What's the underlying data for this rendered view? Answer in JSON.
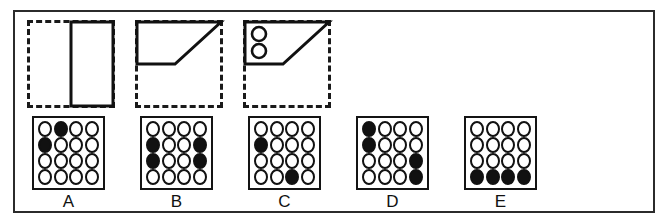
{
  "puzzle": {
    "type": "visual-analogy-matrix",
    "stroke_color": "#111111",
    "fill_color": "#111111",
    "background_color": "#ffffff",
    "frame_color": "#2b2b2b"
  },
  "stimuli": [
    {
      "id": "stimulus-1",
      "description": "dashed square with solid tall rectangle on right half",
      "shape": "rectangle",
      "dashed_box": true,
      "circles": 0
    },
    {
      "id": "stimulus-2",
      "description": "dashed square with solid trapezoid occupying top portion",
      "shape": "trapezoid",
      "dashed_box": true,
      "circles": 0
    },
    {
      "id": "stimulus-3",
      "description": "dashed square with solid trapezoid containing two small circles at upper left",
      "shape": "trapezoid-with-circles",
      "dashed_box": true,
      "circles": 2
    }
  ],
  "options": [
    {
      "label": "A",
      "rows": 4,
      "cols": 4,
      "filled": [
        [
          0,
          1
        ],
        [
          1,
          0
        ]
      ]
    },
    {
      "label": "B",
      "rows": 4,
      "cols": 4,
      "filled": [
        [
          1,
          0
        ],
        [
          1,
          3
        ],
        [
          2,
          0
        ],
        [
          2,
          3
        ]
      ]
    },
    {
      "label": "C",
      "rows": 4,
      "cols": 4,
      "filled": [
        [
          1,
          0
        ],
        [
          3,
          2
        ]
      ]
    },
    {
      "label": "D",
      "rows": 4,
      "cols": 4,
      "filled": [
        [
          0,
          0
        ],
        [
          1,
          0
        ],
        [
          2,
          3
        ],
        [
          3,
          3
        ]
      ]
    },
    {
      "label": "E",
      "rows": 4,
      "cols": 4,
      "filled": [
        [
          3,
          0
        ],
        [
          3,
          1
        ],
        [
          3,
          2
        ],
        [
          3,
          3
        ]
      ]
    }
  ]
}
